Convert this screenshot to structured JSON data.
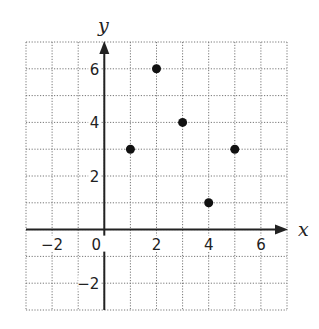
{
  "chart_data": {
    "type": "scatter",
    "title": "",
    "xlabel": "x",
    "ylabel": "y",
    "xlim": [
      -3,
      7
    ],
    "ylim": [
      -3,
      7
    ],
    "grid": true,
    "grid_style": "dotted",
    "x_ticks": [
      {
        "value": -2,
        "label": "−2"
      },
      {
        "value": 0,
        "label": "0"
      },
      {
        "value": 2,
        "label": "2"
      },
      {
        "value": 4,
        "label": "4"
      },
      {
        "value": 6,
        "label": "6"
      }
    ],
    "y_ticks": [
      {
        "value": 6,
        "label": "6"
      },
      {
        "value": 4,
        "label": "4"
      },
      {
        "value": 2,
        "label": "2"
      },
      {
        "value": -2,
        "label": "−2"
      }
    ],
    "series": [
      {
        "name": "points",
        "points": [
          {
            "x": 1,
            "y": 3
          },
          {
            "x": 2,
            "y": 6
          },
          {
            "x": 3,
            "y": 4
          },
          {
            "x": 4,
            "y": 1
          },
          {
            "x": 5,
            "y": 3
          }
        ]
      }
    ],
    "colors": {
      "point": "#111111",
      "axis": "#222222",
      "grid": "#777777"
    }
  }
}
